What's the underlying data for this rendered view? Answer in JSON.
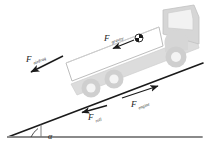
{
  "diagram": {
    "background_color": "#ffffff",
    "line_color": "#1a1a1a",
    "truck_body_color": "#d9d9d9",
    "truck_outline_color": "#b0b0b0",
    "cargo_fill_color": "#ffffff",
    "ground_color": "#8a8a8a"
  },
  "forces": [
    {
      "id": "gravity",
      "symbol": "F",
      "subscript": "gravity",
      "label_x": 104,
      "label_y": 41,
      "direction": "down-left",
      "arrow": {
        "x1": 134,
        "y1": 40,
        "x2": 112,
        "y2": 49
      },
      "description": "Weight component acting from the center of mass"
    },
    {
      "id": "airdrag",
      "symbol": "F",
      "subscript": "airdrag",
      "label_x": 26,
      "label_y": 62,
      "direction": "down-left",
      "arrow": {
        "x1": 62,
        "y1": 57,
        "x2": 30,
        "y2": 73
      },
      "description": "Aerodynamic drag opposing motion"
    },
    {
      "id": "roll",
      "symbol": "F",
      "subscript": "roll",
      "label_x": 88,
      "label_y": 120,
      "direction": "down-left",
      "arrow": {
        "x1": 107,
        "y1": 106,
        "x2": 81,
        "y2": 113
      },
      "description": "Rolling resistance along the incline"
    },
    {
      "id": "engine",
      "symbol": "F",
      "subscript": "engine",
      "label_x": 131,
      "label_y": 107,
      "direction": "up-right",
      "arrow": {
        "x1": 122,
        "y1": 98,
        "x2": 159,
        "y2": 86
      },
      "description": "Driving force from the engine up the slope"
    }
  ],
  "angle": {
    "symbol": "α",
    "label": "α",
    "label_x": 48,
    "label_y": 139,
    "description": "Inclination angle between slope and horizontal ground"
  },
  "geometry": {
    "incline": {
      "x1": 8,
      "y1": 137,
      "x2": 203,
      "y2": 63
    },
    "ground": {
      "x1": 8,
      "y1": 137,
      "x2": 202,
      "y2": 137
    },
    "vertical_marker": {
      "x": 41,
      "y1": 126,
      "y2": 137
    }
  },
  "center_of_mass": {
    "x": 139,
    "y": 38,
    "radius": 4,
    "description": "Center of mass marker"
  },
  "truck": {
    "wheels": [
      {
        "cx": 91,
        "cy": 88,
        "r": 9
      },
      {
        "cx": 114,
        "cy": 79,
        "r": 9
      },
      {
        "cx": 176,
        "cy": 57,
        "r": 10
      }
    ],
    "cargo_box_label": "cargo-body",
    "cab_label": "truck-cab",
    "window_label": "cab-window"
  }
}
